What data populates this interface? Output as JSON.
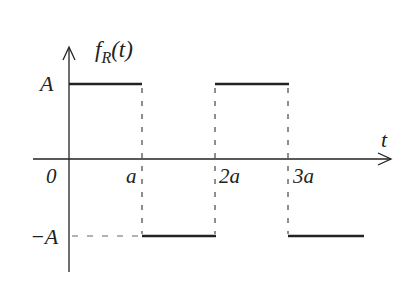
{
  "diagram": {
    "function_label": "f",
    "function_subscript": "R",
    "function_arg": "(t)",
    "x_axis_label": "t",
    "y_labels": {
      "positive": "A",
      "negative": "−A"
    },
    "x_ticks": [
      "0",
      "a",
      "2a",
      "3a"
    ],
    "segments": [
      {
        "from": "0",
        "to": "a",
        "level": "A"
      },
      {
        "from": "a",
        "to": "2a",
        "level": "-A"
      },
      {
        "from": "2a",
        "to": "3a",
        "level": "A"
      },
      {
        "from": "3a",
        "to": "4a",
        "level": "-A"
      }
    ],
    "colors": {
      "line": "#222222",
      "dash": "#444444"
    }
  }
}
